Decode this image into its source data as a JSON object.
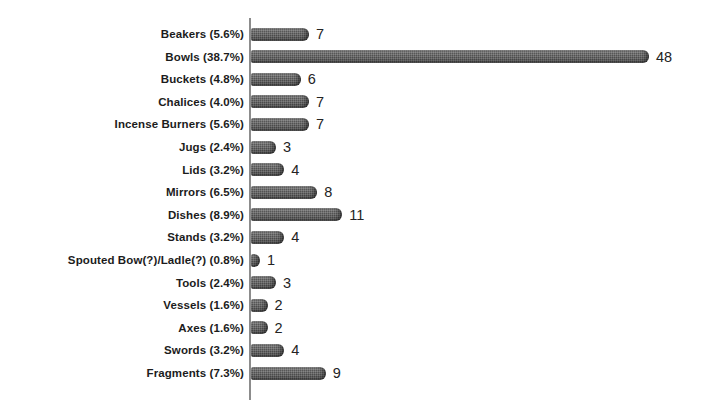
{
  "chart_data": {
    "type": "bar",
    "orientation": "horizontal",
    "title": "",
    "subtitle": "",
    "xlabel": "",
    "ylabel": "",
    "grid": false,
    "legend": "none",
    "xlim": [
      0,
      48
    ],
    "value_labels_shown": true,
    "categories": [
      "Beakers (5.6%)",
      "Bowls (38.7%)",
      "Buckets (4.8%)",
      "Chalices (4.0%)",
      "Incense Burners (5.6%)",
      "Jugs (2.4%)",
      "Lids (3.2%)",
      "Mirrors (6.5%)",
      "Dishes (8.9%)",
      "Stands (3.2%)",
      "Spouted Bow(?)/Ladle(?) (0.8%)",
      "Tools (2.4%)",
      "Vessels (1.6%)",
      "Axes (1.6%)",
      "Swords (3.2%)",
      "Fragments (7.3%)"
    ],
    "values": [
      7,
      48,
      6,
      7,
      7,
      3,
      4,
      8,
      11,
      4,
      1,
      3,
      2,
      2,
      4,
      9
    ],
    "percents": [
      5.6,
      38.7,
      4.8,
      4.0,
      5.6,
      2.4,
      3.2,
      6.5,
      8.9,
      3.2,
      0.8,
      2.4,
      1.6,
      1.6,
      3.2,
      7.3
    ],
    "bar_color": "#4e4e4e",
    "axis_color": "#8c8c8c",
    "background_color": "#ffffff"
  }
}
